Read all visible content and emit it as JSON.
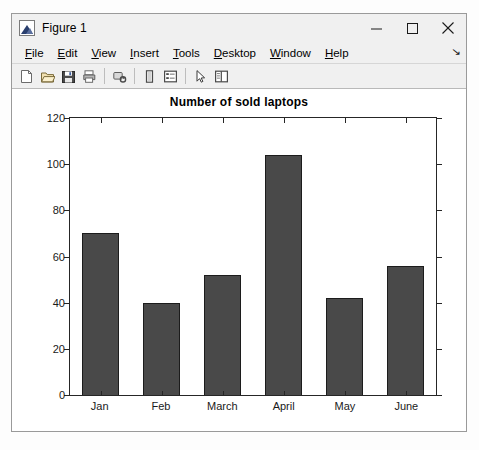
{
  "window": {
    "title": "Figure 1",
    "icon": "matlab-figure-icon",
    "controls": {
      "minimize": "minimize-button",
      "maximize": "maximize-button",
      "close": "close-button"
    }
  },
  "menubar": {
    "items": [
      {
        "label": "File",
        "mnemonic": "F"
      },
      {
        "label": "Edit",
        "mnemonic": "E"
      },
      {
        "label": "View",
        "mnemonic": "V"
      },
      {
        "label": "Insert",
        "mnemonic": "I"
      },
      {
        "label": "Tools",
        "mnemonic": "T"
      },
      {
        "label": "Desktop",
        "mnemonic": "D"
      },
      {
        "label": "Window",
        "mnemonic": "W"
      },
      {
        "label": "Help",
        "mnemonic": "H"
      }
    ],
    "overflow": "↘"
  },
  "toolbar": {
    "buttons": [
      {
        "name": "new-figure-icon",
        "tooltip": "New Figure"
      },
      {
        "name": "open-file-icon",
        "tooltip": "Open File"
      },
      {
        "name": "save-figure-icon",
        "tooltip": "Save Figure"
      },
      {
        "name": "print-figure-icon",
        "tooltip": "Print Figure"
      },
      {
        "name": "link-plot-icon",
        "tooltip": "Link Plot"
      },
      {
        "name": "insert-colorbar-icon",
        "tooltip": "Insert Colorbar"
      },
      {
        "name": "insert-legend-icon",
        "tooltip": "Insert Legend"
      },
      {
        "name": "edit-plot-icon",
        "tooltip": "Edit Plot"
      },
      {
        "name": "plot-browser-icon",
        "tooltip": "Show Plot Tools and Dock Figure"
      }
    ]
  },
  "colors": {
    "bar_fill": "#494949",
    "bar_edge": "#1c1c1c",
    "axes_line": "#262626",
    "figure_background": "#ffffff",
    "window_chrome": "#f0f0f0"
  },
  "chart_data": {
    "type": "bar",
    "title": "Number of sold laptops",
    "xlabel": "",
    "ylabel": "",
    "categories": [
      "Jan",
      "Feb",
      "March",
      "April",
      "May",
      "June"
    ],
    "values": [
      70,
      40,
      52,
      104,
      42,
      56
    ],
    "ylim": [
      0,
      120
    ],
    "yticks": [
      0,
      20,
      40,
      60,
      80,
      100,
      120
    ],
    "grid": false,
    "legend": null
  }
}
